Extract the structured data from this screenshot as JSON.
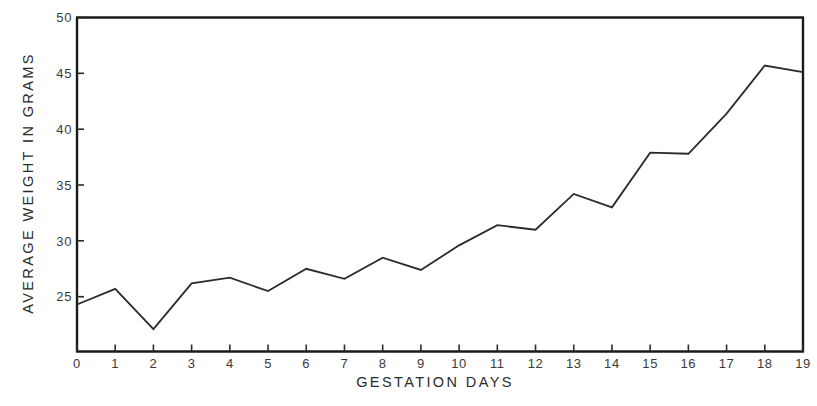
{
  "chart_data": {
    "type": "line",
    "title": "",
    "xlabel": "GESTATION DAYS",
    "ylabel": "AVERAGE WEIGHT IN GRAMS",
    "x": [
      0,
      1,
      2,
      3,
      4,
      5,
      6,
      7,
      8,
      9,
      10,
      11,
      12,
      13,
      14,
      15,
      16,
      17,
      18,
      19
    ],
    "values": [
      24.3,
      25.7,
      22.1,
      26.2,
      26.7,
      25.5,
      27.5,
      26.6,
      28.5,
      27.4,
      29.6,
      31.4,
      31.0,
      34.2,
      33.0,
      37.9,
      37.8,
      41.4,
      45.7,
      45.1
    ],
    "xtick_labels": [
      "0",
      "1",
      "2",
      "3",
      "4",
      "5",
      "6",
      "7",
      "8",
      "9",
      "10",
      "11",
      "12",
      "13",
      "14",
      "15",
      "16",
      "17",
      "18",
      "19"
    ],
    "ytick_labels": [
      "25",
      "30",
      "35",
      "40",
      "45",
      "50"
    ],
    "ytick_values": [
      25,
      30,
      35,
      40,
      45,
      50
    ],
    "xlim": [
      0,
      19
    ],
    "ylim": [
      20,
      50
    ],
    "grid": false,
    "legend": false,
    "line_color": "#2b2b2b",
    "frame_color": "#1a1a1a"
  }
}
